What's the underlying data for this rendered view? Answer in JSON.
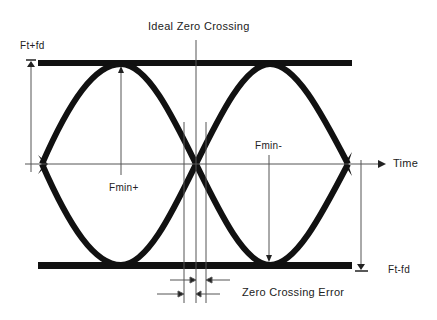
{
  "title": "Ideal Zero Crossing",
  "labels": {
    "top_level": "Ft+fd",
    "bottom_level": "Ft-fd",
    "axis": "Time",
    "fmin_plus": "Fmin+",
    "fmin_minus": "Fmin-",
    "zero_crossing_error": "Zero Crossing Error"
  },
  "colors": {
    "stroke": "#111111",
    "thin_line": "#555555",
    "text": "#222222",
    "background": "#ffffff"
  }
}
